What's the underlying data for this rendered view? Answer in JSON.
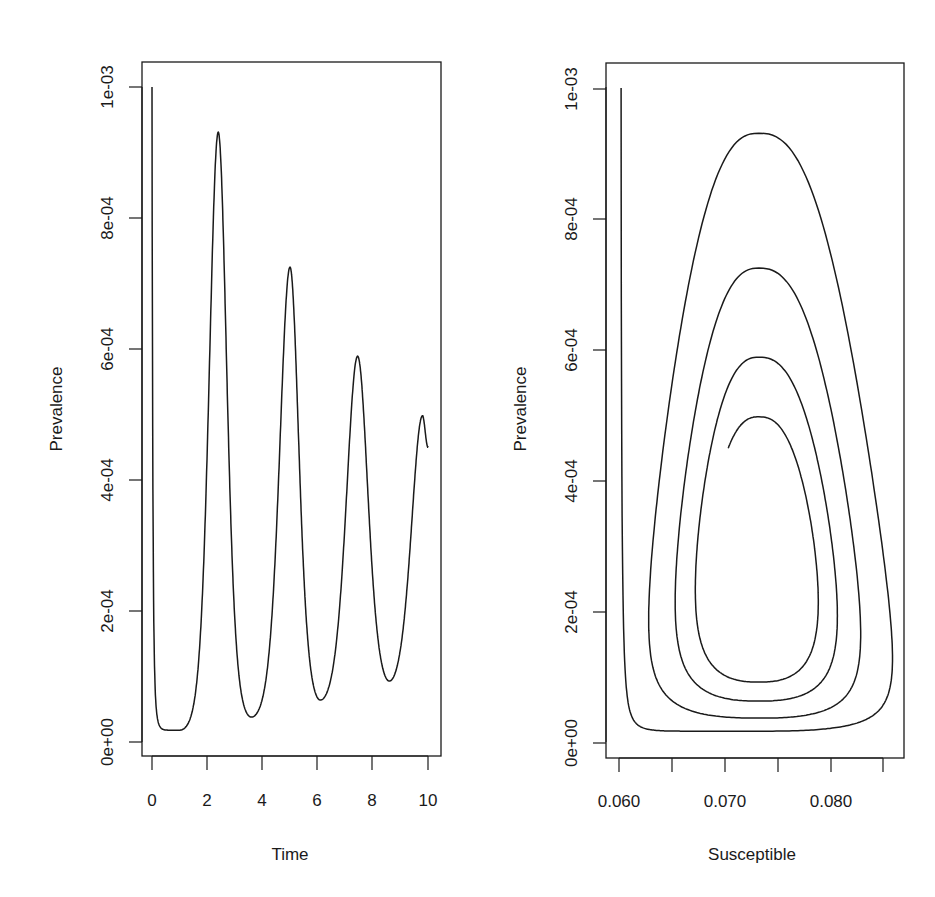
{
  "figure": {
    "background": "#ffffff",
    "line_color": "#1a1a1a"
  },
  "chart_data": [
    {
      "type": "line",
      "title": "",
      "xlabel": "Time",
      "ylabel": "Prevalence",
      "xlim": [
        -0.25,
        10.5
      ],
      "ylim": [
        -2e-05,
        0.00108
      ],
      "xticks": [
        0,
        2,
        4,
        6,
        8,
        10
      ],
      "xtick_labels": [
        "0",
        "2",
        "4",
        "6",
        "8",
        "10"
      ],
      "yticks": [
        0,
        0.0002,
        0.0004,
        0.0006,
        0.0008,
        0.001
      ],
      "ytick_labels": [
        "0e+00",
        "2e-04",
        "4e-04",
        "6e-04",
        "8e-04",
        "1e-03"
      ],
      "grid": false,
      "legend": null,
      "series": [
        {
          "name": "Prevalence over time",
          "key_points": [
            {
              "t": 0.0,
              "I": 0.001,
              "kind": "start"
            },
            {
              "t": 1.0,
              "I": 1.8e-05,
              "kind": "trough"
            },
            {
              "t": 2.4,
              "I": 0.000931,
              "kind": "peak"
            },
            {
              "t": 3.6,
              "I": 3.8e-05,
              "kind": "trough"
            },
            {
              "t": 5.0,
              "I": 0.000725,
              "kind": "peak"
            },
            {
              "t": 6.1,
              "I": 6.4e-05,
              "kind": "trough"
            },
            {
              "t": 7.45,
              "I": 0.000589,
              "kind": "peak"
            },
            {
              "t": 8.6,
              "I": 9.3e-05,
              "kind": "trough"
            },
            {
              "t": 9.8,
              "I": 0.000498,
              "kind": "peak"
            },
            {
              "t": 10.0,
              "I": 0.00045,
              "kind": "end"
            }
          ]
        }
      ]
    },
    {
      "type": "line",
      "title": "",
      "xlabel": "Susceptible",
      "ylabel": "Prevalence",
      "xlim": [
        0.059,
        0.0875
      ],
      "ylim": [
        -2e-05,
        0.00108
      ],
      "xticks": [
        0.06,
        0.065,
        0.07,
        0.075,
        0.08,
        0.085
      ],
      "xtick_labels": [
        "0.060",
        "",
        "0.070",
        "",
        "0.080",
        ""
      ],
      "yticks": [
        0,
        0.0002,
        0.0004,
        0.0006,
        0.0008,
        0.001
      ],
      "ytick_labels": [
        "0e+00",
        "2e-04",
        "4e-04",
        "6e-04",
        "8e-04",
        "1e-03"
      ],
      "grid": false,
      "legend": null,
      "series": [
        {
          "name": "Phase plane trajectory (S vs I)",
          "start": {
            "S": 0.0602,
            "I": 0.001
          },
          "center_S": 0.0732,
          "cycles": [
            {
              "trough_I": 1.8e-05,
              "peak_I": 0.000931,
              "S_right": 0.0858,
              "S_left": 0.0628
            },
            {
              "trough_I": 3.8e-05,
              "peak_I": 0.000725,
              "S_right": 0.0828,
              "S_left": 0.0653
            },
            {
              "trough_I": 6.4e-05,
              "peak_I": 0.000589,
              "S_right": 0.0806,
              "S_left": 0.0672
            },
            {
              "trough_I": 9.3e-05,
              "peak_I": 0.000498,
              "S_right": 0.0788,
              "S_left": null
            }
          ],
          "end": {
            "S": 0.0703,
            "I": 0.00045
          }
        }
      ]
    }
  ],
  "panels": [
    {
      "xlabel": "Time",
      "ylabel": "Prevalence",
      "xtick_labels": [
        "0",
        "2",
        "4",
        "6",
        "8",
        "10"
      ],
      "ytick_labels": [
        "0e+00",
        "2e-04",
        "4e-04",
        "6e-04",
        "8e-04",
        "1e-03"
      ]
    },
    {
      "xlabel": "Susceptible",
      "ylabel": "Prevalence",
      "xtick_labels": [
        "0.060",
        "0.070",
        "0.080"
      ],
      "ytick_labels": [
        "0e+00",
        "2e-04",
        "4e-04",
        "6e-04",
        "8e-04",
        "1e-03"
      ]
    }
  ]
}
